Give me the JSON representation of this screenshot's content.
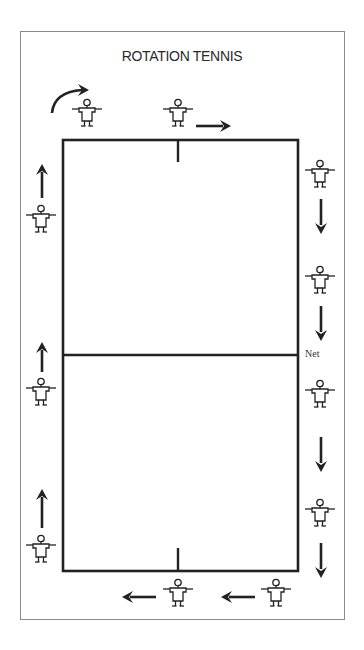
{
  "title": "ROTATION TENNIS",
  "labels": {
    "net": "Net"
  },
  "colors": {
    "ink": "#222222",
    "frame": "#8a8a8a",
    "background": "#ffffff"
  },
  "court": {
    "left": 63,
    "top": 140,
    "right": 298,
    "bottom": 571,
    "net_y": 355,
    "center_x": 178,
    "top_center_mark_end_y": 162,
    "bottom_center_mark_start_y": 548
  },
  "players": [
    {
      "id": "top-left",
      "x": 87,
      "y": 103,
      "side": "top"
    },
    {
      "id": "top-center",
      "x": 178,
      "y": 103,
      "side": "top"
    },
    {
      "id": "right-1",
      "x": 320,
      "y": 175,
      "side": "right"
    },
    {
      "id": "right-2",
      "x": 320,
      "y": 282,
      "side": "right"
    },
    {
      "id": "right-3",
      "x": 320,
      "y": 392,
      "side": "right"
    },
    {
      "id": "right-4",
      "x": 320,
      "y": 510,
      "side": "right"
    },
    {
      "id": "bottom-right",
      "x": 276,
      "y": 580,
      "side": "bottom"
    },
    {
      "id": "bottom-center",
      "x": 178,
      "y": 580,
      "side": "bottom"
    },
    {
      "id": "left-1",
      "x": 41,
      "y": 527,
      "side": "left"
    },
    {
      "id": "left-2",
      "x": 41,
      "y": 367,
      "side": "left"
    },
    {
      "id": "left-3",
      "x": 41,
      "y": 205,
      "side": "left"
    }
  ],
  "arrows": [
    {
      "id": "curved-top-left",
      "direction": "curve-right"
    },
    {
      "id": "top-right",
      "direction": "right"
    },
    {
      "id": "right-1",
      "direction": "down"
    },
    {
      "id": "right-2",
      "direction": "down"
    },
    {
      "id": "right-3",
      "direction": "down"
    },
    {
      "id": "right-4",
      "direction": "down"
    },
    {
      "id": "bottom-1",
      "direction": "left"
    },
    {
      "id": "bottom-2",
      "direction": "left"
    },
    {
      "id": "left-1",
      "direction": "up"
    },
    {
      "id": "left-2",
      "direction": "up"
    },
    {
      "id": "left-3",
      "direction": "up"
    }
  ]
}
